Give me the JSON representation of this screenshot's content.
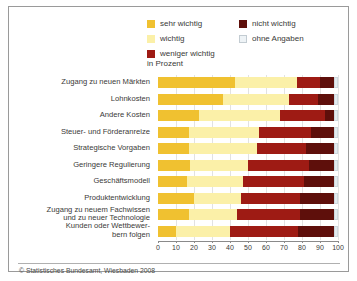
{
  "legend": {
    "columns": [
      [
        {
          "label": "sehr wichtig",
          "color": "#f0c130",
          "key": "sehr_wichtig"
        },
        {
          "label": "wichtig",
          "color": "#fbf0a8",
          "key": "wichtig"
        },
        {
          "label": "weniger wichtig",
          "color": "#9e1b14",
          "key": "weniger_wichtig"
        }
      ],
      [
        {
          "label": "nicht wichtig",
          "color": "#5e0f0b",
          "key": "nicht_wichtig"
        },
        {
          "label": "ohne Angaben",
          "color": "#e4ebef",
          "key": "ohne_angaben"
        }
      ]
    ],
    "unit": "in Prozent"
  },
  "footer": {
    "source": "© Statistisches Bundesamt, Wiesbaden 2008"
  },
  "chart_data": {
    "type": "bar",
    "orientation": "horizontal",
    "stacked": true,
    "stacked_percent": true,
    "title": "",
    "subtitle": "",
    "xlabel": "in Prozent",
    "ylabel": "",
    "xlim": [
      0,
      100
    ],
    "xticks": [
      0,
      10,
      20,
      30,
      40,
      50,
      60,
      70,
      80,
      90,
      100
    ],
    "xtick_labels": [
      "0",
      "10",
      "20",
      "30",
      "40",
      "50",
      "60",
      "70",
      "80",
      "90",
      "100"
    ],
    "grid": true,
    "legend_position": "top",
    "categories": [
      "Zugang zu neuen Märkten",
      "Lohnkosten",
      "Andere Kosten",
      "Steuer- und Förderanreize",
      "Strategische Vorgaben",
      "Geringere Regulierung",
      "Geschäftsmodell",
      "Produktentwicklung",
      "Zugang zu neuem Fachwissen\nund zu neuer Technologie",
      "Kunden oder Wettbewer-\nbern folgen"
    ],
    "series": [
      {
        "name": "sehr wichtig",
        "color": "#f0c130",
        "values": [
          43,
          36,
          23,
          17,
          17,
          18,
          16,
          20,
          17,
          10
        ]
      },
      {
        "name": "wichtig",
        "color": "#fbf0a8",
        "values": [
          34,
          37,
          45,
          39,
          38,
          32,
          31,
          26,
          27,
          30
        ]
      },
      {
        "name": "weniger wichtig",
        "color": "#9e1b14",
        "values": [
          13,
          16,
          25,
          29,
          27,
          34,
          34,
          33,
          35,
          38
        ]
      },
      {
        "name": "nicht wichtig",
        "color": "#5e0f0b",
        "values": [
          8,
          9,
          5,
          13,
          16,
          14,
          17,
          19,
          19,
          20
        ]
      },
      {
        "name": "ohne Angaben",
        "color": "#e4ebef",
        "values": [
          2,
          2,
          2,
          2,
          2,
          2,
          2,
          2,
          2,
          2
        ]
      }
    ]
  }
}
